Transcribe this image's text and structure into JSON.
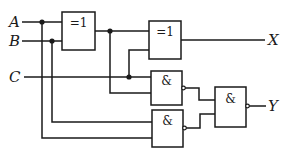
{
  "diagram": {
    "type": "logic-circuit",
    "inputs": [
      {
        "id": "A",
        "label": "A"
      },
      {
        "id": "B",
        "label": "B"
      },
      {
        "id": "C",
        "label": "C"
      }
    ],
    "outputs": [
      {
        "id": "X",
        "label": "X"
      },
      {
        "id": "Y",
        "label": "Y"
      }
    ],
    "gates": [
      {
        "id": "g1",
        "type": "XOR",
        "symbol": "=1",
        "inputs": [
          "A",
          "B"
        ]
      },
      {
        "id": "g2",
        "type": "XOR",
        "symbol": "=1",
        "inputs": [
          "g1",
          "C"
        ],
        "output": "X"
      },
      {
        "id": "g3",
        "type": "NAND",
        "symbol": "&",
        "inputs": [
          "C",
          "g1"
        ]
      },
      {
        "id": "g4",
        "type": "NAND",
        "symbol": "&",
        "inputs": [
          "B",
          "A"
        ]
      },
      {
        "id": "g5",
        "type": "NAND",
        "symbol": "&",
        "inputs": [
          "g3",
          "g4"
        ],
        "output": "Y"
      }
    ],
    "colors": {
      "line": "#1a1a1a",
      "background": "#ffffff"
    }
  }
}
